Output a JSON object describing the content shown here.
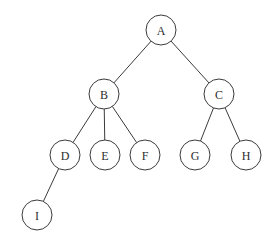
{
  "diagram": {
    "type": "rooted-tree",
    "background_color": "#ffffff",
    "stroke_color": "#3b3b3b",
    "node_fill_color": "#ffffff",
    "label_color": "#2e2e2e",
    "node_radius": 15,
    "root": "A",
    "nodes": [
      {
        "id": "A",
        "label": "A",
        "cx": 161,
        "cy": 30,
        "depth": 0,
        "parent": null
      },
      {
        "id": "B",
        "label": "B",
        "cx": 104,
        "cy": 94,
        "depth": 1,
        "parent": "A"
      },
      {
        "id": "C",
        "label": "C",
        "cx": 219,
        "cy": 94,
        "depth": 1,
        "parent": "A"
      },
      {
        "id": "D",
        "label": "D",
        "cx": 65,
        "cy": 155,
        "depth": 2,
        "parent": "B"
      },
      {
        "id": "E",
        "label": "E",
        "cx": 105,
        "cy": 155,
        "depth": 2,
        "parent": "B"
      },
      {
        "id": "F",
        "label": "F",
        "cx": 145,
        "cy": 155,
        "depth": 2,
        "parent": "B"
      },
      {
        "id": "G",
        "label": "G",
        "cx": 195,
        "cy": 155,
        "depth": 2,
        "parent": "C"
      },
      {
        "id": "H",
        "label": "H",
        "cx": 246,
        "cy": 155,
        "depth": 2,
        "parent": "C"
      },
      {
        "id": "I",
        "label": "I",
        "cx": 37,
        "cy": 215,
        "depth": 3,
        "parent": "D"
      }
    ],
    "edges": [
      {
        "from": "A",
        "to": "B"
      },
      {
        "from": "A",
        "to": "C"
      },
      {
        "from": "B",
        "to": "D"
      },
      {
        "from": "B",
        "to": "E"
      },
      {
        "from": "B",
        "to": "F"
      },
      {
        "from": "C",
        "to": "G"
      },
      {
        "from": "C",
        "to": "H"
      },
      {
        "from": "D",
        "to": "I"
      }
    ]
  }
}
